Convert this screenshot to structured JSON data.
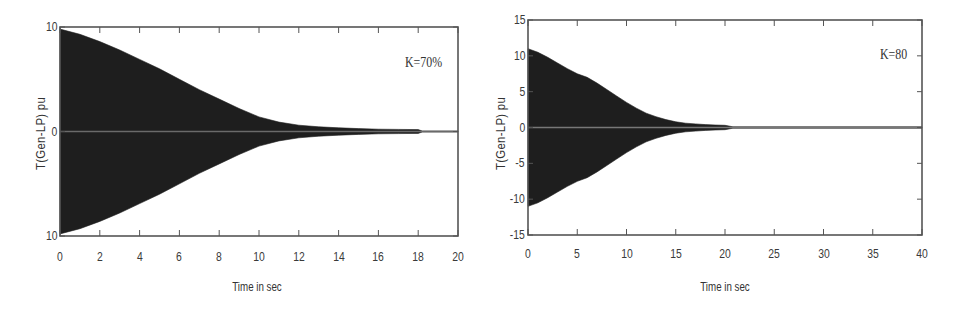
{
  "chart_data": [
    {
      "type": "area",
      "title": "",
      "annotation": "K=70%",
      "xlabel": "Time in sec",
      "ylabel": "T(Gen-LP) pu",
      "xlim": [
        0,
        20
      ],
      "ylim": [
        -10,
        10
      ],
      "xticks": [
        0,
        2,
        4,
        6,
        8,
        10,
        12,
        14,
        16,
        18,
        20
      ],
      "xtick_labels": [
        "0",
        "2",
        "4",
        "6",
        "8",
        "10",
        "12",
        "14",
        "16",
        "18",
        "20"
      ],
      "yticks": [
        10,
        0,
        -10
      ],
      "ytick_labels": [
        "10",
        "0",
        "10"
      ],
      "grid": false,
      "legend": null,
      "series": [
        {
          "name": "oscillation envelope (damped torque)",
          "x": [
            0,
            1,
            2,
            3,
            4,
            5,
            6,
            7,
            8,
            9,
            10,
            11,
            12,
            13,
            14,
            15,
            16,
            17,
            18,
            18.2,
            20
          ],
          "upper": [
            9.8,
            9.3,
            8.6,
            7.8,
            6.9,
            6.0,
            5.0,
            4.0,
            3.1,
            2.2,
            1.4,
            0.9,
            0.6,
            0.45,
            0.35,
            0.28,
            0.22,
            0.2,
            0.18,
            0.05,
            0.05
          ],
          "lower": [
            -9.8,
            -9.3,
            -8.6,
            -7.8,
            -6.9,
            -6.0,
            -5.0,
            -4.0,
            -3.1,
            -2.2,
            -1.4,
            -0.9,
            -0.6,
            -0.45,
            -0.35,
            -0.28,
            -0.22,
            -0.2,
            -0.18,
            -0.05,
            -0.05
          ]
        }
      ],
      "colors": {
        "fill": "#1e1e1e",
        "axis": "#555555",
        "tail": "#6a6a6a"
      }
    },
    {
      "type": "area",
      "title": "",
      "annotation": "K=80",
      "xlabel": "Time in sec",
      "ylabel": "T(Gen-LP) pu",
      "xlim": [
        0,
        40
      ],
      "ylim": [
        -15,
        15
      ],
      "xticks": [
        0,
        5,
        10,
        15,
        20,
        25,
        30,
        35,
        40
      ],
      "xtick_labels": [
        "0",
        "5",
        "10",
        "15",
        "20",
        "25",
        "30",
        "35",
        "40"
      ],
      "yticks": [
        15,
        10,
        5,
        0,
        -5,
        -10,
        -15
      ],
      "ytick_labels": [
        "15",
        "10",
        "5",
        "0",
        "-5",
        "-10",
        "-15"
      ],
      "grid": false,
      "legend": null,
      "series": [
        {
          "name": "oscillation envelope (damped torque)",
          "x": [
            0,
            1,
            2,
            3,
            4,
            5,
            6,
            7,
            8,
            9,
            10,
            11,
            12,
            13,
            14,
            15,
            16,
            17,
            18,
            19,
            20,
            20.8,
            40
          ],
          "upper": [
            11.0,
            10.5,
            9.8,
            9.0,
            8.2,
            7.5,
            7.0,
            6.2,
            5.3,
            4.4,
            3.5,
            2.7,
            2.0,
            1.5,
            1.1,
            0.8,
            0.6,
            0.5,
            0.4,
            0.35,
            0.3,
            0.1,
            0.1
          ],
          "lower": [
            -11.0,
            -10.5,
            -9.8,
            -9.0,
            -8.2,
            -7.5,
            -7.0,
            -6.2,
            -5.3,
            -4.4,
            -3.5,
            -2.7,
            -2.0,
            -1.5,
            -1.1,
            -0.8,
            -0.6,
            -0.5,
            -0.4,
            -0.35,
            -0.3,
            -0.1,
            -0.1
          ]
        }
      ],
      "colors": {
        "fill": "#1e1e1e",
        "axis": "#555555",
        "tail": "#777777"
      }
    }
  ]
}
